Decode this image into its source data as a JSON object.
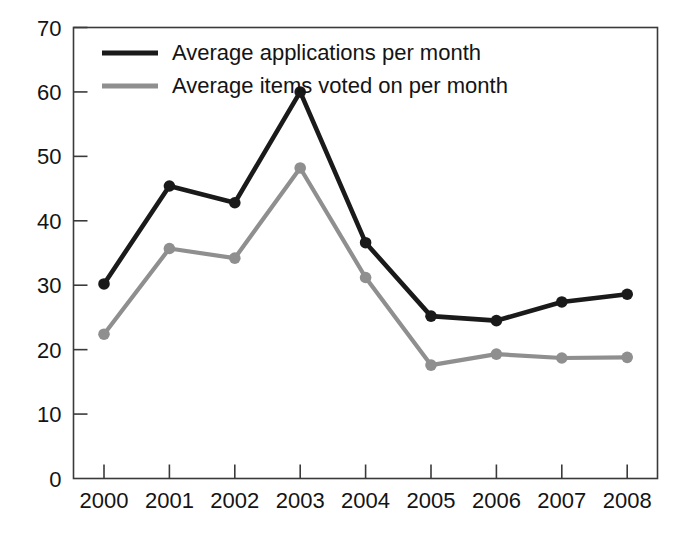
{
  "chart_data": {
    "type": "line",
    "title": "",
    "subtitle": "",
    "xlabel": "",
    "ylabel": "",
    "categories": [
      "2000",
      "2001",
      "2002",
      "2003",
      "2004",
      "2005",
      "2006",
      "2007",
      "2008"
    ],
    "xlim": [
      2000,
      2008
    ],
    "ylim": [
      0,
      70
    ],
    "y_ticks": [
      "0",
      "10",
      "20",
      "30",
      "40",
      "50",
      "60",
      "70"
    ],
    "y_tick_values": [
      0,
      10,
      20,
      30,
      40,
      50,
      60,
      70
    ],
    "grid": false,
    "legend_position": "top-left inside plot area",
    "series": [
      {
        "name": "Average applications per month",
        "color": "#1a1a1a",
        "marker": "circle",
        "values": [
          30.2,
          45.4,
          42.8,
          60.0,
          36.6,
          25.2,
          24.5,
          27.4,
          28.6
        ]
      },
      {
        "name": "Average items voted on per month",
        "color": "#8f8f8f",
        "marker": "circle",
        "values": [
          22.4,
          35.7,
          34.2,
          48.2,
          31.2,
          17.6,
          19.3,
          18.7,
          18.8
        ]
      }
    ]
  },
  "legend": {
    "entries": [
      {
        "label": "Average applications per month",
        "color": "#1a1a1a"
      },
      {
        "label": "Average items voted on per month",
        "color": "#8f8f8f"
      }
    ]
  },
  "colors": {
    "series_primary": "#1a1a1a",
    "series_secondary": "#8f8f8f",
    "axis": "#3a3a3a",
    "background": "#ffffff",
    "text": "#141414"
  }
}
